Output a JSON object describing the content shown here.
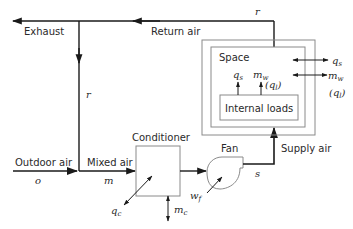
{
  "labels": {
    "exhaust": "Exhaust",
    "return_air": "Return air",
    "outdoor_air": "Outdoor air",
    "mixed_air": "Mixed air",
    "conditioner": "Conditioner",
    "fan": "Fan",
    "supply_air": "Supply air",
    "space": "Space",
    "internal_loads": "Internal loads"
  },
  "variables": {
    "return_top": "r",
    "recirc": "r",
    "outdoor": "o",
    "mixed": "m",
    "supply": "s",
    "conditioner_heat": "q",
    "conditioner_heat_sub": "c",
    "conditioner_mass": "m",
    "conditioner_mass_sub": "c",
    "fan_work": "w",
    "fan_work_sub": "f",
    "internal_qs": "q",
    "internal_qs_sub": "s",
    "internal_mw": "m",
    "internal_mw_sub": "w",
    "internal_ql": "(q",
    "internal_ql_sub": "l",
    "internal_ql_close": ")",
    "boundary_qs": "q",
    "boundary_qs_sub": "s",
    "boundary_mw": "m",
    "boundary_mw_sub": "w",
    "boundary_ql": "(q",
    "boundary_ql_sub": "l",
    "boundary_ql_close": ")"
  },
  "colors": {
    "line": "#1a1a1a",
    "box": "#8a8a8a",
    "text": "#2a2a2a"
  }
}
